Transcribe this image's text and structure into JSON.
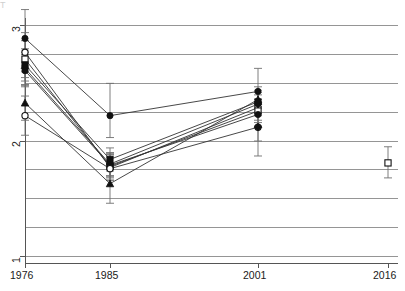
{
  "chart_data": {
    "type": "line",
    "title": "",
    "subtitle": "",
    "xlabel": "",
    "ylabel": "",
    "x": [
      1976,
      1985,
      2001,
      2016
    ],
    "x_positions": [
      25,
      110,
      258,
      388
    ],
    "xlim": [
      1970,
      2020
    ],
    "ylim": [
      1.0,
      3.15
    ],
    "yticks": [
      1,
      2,
      3
    ],
    "ytick_labels": [
      "1",
      "2",
      "3"
    ],
    "gridlines_y": [
      3.0,
      2.75,
      2.5,
      2.25,
      2.0,
      1.75,
      1.5,
      1.25,
      1.0
    ],
    "grid": true,
    "grid_color": "#8a8a8a",
    "legend": "none",
    "marker_color": "#111111",
    "line_color": "#333333",
    "errorbar_color": "#6f6f6f",
    "series": [
      {
        "name": "series-1",
        "marker": "filled-circle",
        "values": [
          2.89,
          2.22,
          2.43,
          null
        ],
        "errors_low": [
          2.65,
          2.03,
          2.22,
          null
        ],
        "errors_high": [
          3.14,
          2.5,
          2.63,
          null
        ]
      },
      {
        "name": "series-2",
        "marker": "open-circle",
        "values": [
          2.77,
          1.77,
          2.29,
          null
        ],
        "errors_low": [
          2.6,
          1.66,
          2.18,
          null
        ],
        "errors_high": [
          2.94,
          1.88,
          2.4,
          null
        ]
      },
      {
        "name": "series-3",
        "marker": "open-square",
        "values": [
          2.71,
          1.78,
          2.26,
          null
        ],
        "errors_low": [
          2.55,
          1.68,
          2.16,
          null
        ],
        "errors_high": [
          2.87,
          1.88,
          2.36,
          null
        ]
      },
      {
        "name": "series-4",
        "marker": "filled-square",
        "values": [
          2.66,
          1.84,
          2.34,
          null
        ],
        "errors_low": [
          2.52,
          1.74,
          2.24,
          null
        ],
        "errors_high": [
          2.8,
          1.94,
          2.44,
          null
        ]
      },
      {
        "name": "series-5",
        "marker": "filled-diamond",
        "values": [
          2.63,
          1.8,
          2.32,
          null
        ],
        "errors_low": [
          2.49,
          1.7,
          2.22,
          null
        ],
        "errors_high": [
          2.77,
          1.9,
          2.42,
          null
        ]
      },
      {
        "name": "series-6",
        "marker": "filled-circle",
        "values": [
          2.61,
          1.79,
          2.23,
          null
        ],
        "errors_low": [
          2.47,
          1.69,
          2.13,
          null
        ],
        "errors_high": [
          2.75,
          1.89,
          2.33,
          null
        ]
      },
      {
        "name": "series-7",
        "marker": "filled-triangle",
        "values": [
          2.33,
          1.63,
          2.36,
          null
        ],
        "errors_low": [
          2.18,
          1.46,
          2.25,
          null
        ],
        "errors_high": [
          2.48,
          1.8,
          2.47,
          null
        ]
      },
      {
        "name": "series-8",
        "marker": "open-circle",
        "values": [
          2.22,
          1.76,
          2.12,
          null
        ],
        "errors_low": [
          2.05,
          1.66,
          2.0,
          null
        ],
        "errors_high": [
          2.39,
          1.86,
          2.24,
          null
        ]
      },
      {
        "name": "series-9",
        "marker": "filled-diamond",
        "values": [
          null,
          null,
          2.12,
          null
        ],
        "errors_low": [
          null,
          null,
          1.87,
          null
        ],
        "errors_high": [
          null,
          null,
          2.3,
          null
        ]
      },
      {
        "name": "series-10-2016",
        "marker": "open-square",
        "values": [
          null,
          null,
          null,
          1.81
        ],
        "errors_low": [
          null,
          null,
          null,
          1.68
        ],
        "errors_high": [
          null,
          null,
          null,
          1.95
        ]
      }
    ]
  },
  "axis": {
    "x_tick_labels": [
      "1976",
      "1985",
      "2001",
      "2016"
    ],
    "y_tick_labels": [
      "3",
      "2",
      "1"
    ]
  },
  "top_cutoff_text": "T"
}
